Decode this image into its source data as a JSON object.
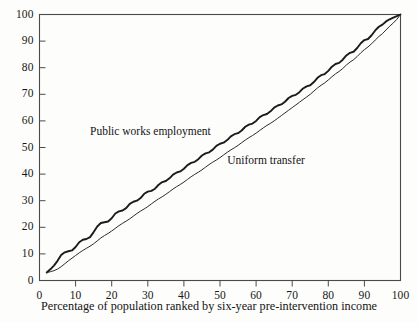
{
  "chart_data": {
    "type": "line",
    "title": "",
    "subtitle": "",
    "xlabel": "Percentage of population ranked by six-year pre-intervention income",
    "ylabel": "",
    "xlim": [
      0,
      100
    ],
    "ylim": [
      0,
      100
    ],
    "grid": false,
    "legend_position": "inline-annotations",
    "xticks": [
      "0",
      "10",
      "20",
      "30",
      "40",
      "50",
      "60",
      "70",
      "80",
      "90",
      "100"
    ],
    "yticks": [
      "0",
      "10",
      "20",
      "30",
      "40",
      "50",
      "60",
      "70",
      "80",
      "90",
      "100"
    ],
    "xtick_values": [
      0,
      10,
      20,
      30,
      40,
      50,
      60,
      70,
      80,
      90,
      100
    ],
    "ytick_values": [
      0,
      10,
      20,
      30,
      40,
      50,
      60,
      70,
      80,
      90,
      100
    ],
    "annotations": [
      {
        "text": "Public works employment",
        "x": 14,
        "y": 56
      },
      {
        "text": "Uniform transfer",
        "x": 52,
        "y": 45
      }
    ],
    "series": [
      {
        "name": "Public works employment",
        "style": "solid",
        "width": 1.9,
        "color": "#1b1b1b",
        "x": [
          2.0,
          3.0,
          4.0,
          5.0,
          6.0,
          7.0,
          8.0,
          9.0,
          10.0,
          11.0,
          12.0,
          13.0,
          14.0,
          15.0,
          16.0,
          17.0,
          18.0,
          19.0,
          20.0,
          21.0,
          22.0,
          23.0,
          24.0,
          25.0,
          26.0,
          27.0,
          28.0,
          29.0,
          30.0,
          31.0,
          32.0,
          33.0,
          34.0,
          35.0,
          36.0,
          37.0,
          38.0,
          39.0,
          40.0,
          41.0,
          42.0,
          43.0,
          44.0,
          45.0,
          46.0,
          47.0,
          48.0,
          49.0,
          50.0,
          51.0,
          52.0,
          53.0,
          54.0,
          55.0,
          56.0,
          57.0,
          58.0,
          59.0,
          60.0,
          61.0,
          62.0,
          63.0,
          64.0,
          65.0,
          66.0,
          67.0,
          68.0,
          69.0,
          70.0,
          71.0,
          72.0,
          73.0,
          74.0,
          75.0,
          76.0,
          77.0,
          78.0,
          79.0,
          80.0,
          81.0,
          82.0,
          83.0,
          84.0,
          85.0,
          86.0,
          87.0,
          88.0,
          89.0,
          90.0,
          91.0,
          92.0,
          93.0,
          94.0,
          95.0,
          96.0,
          97.0,
          98.0,
          99.0,
          100.0
        ],
        "y": [
          3.0,
          4.2,
          5.6,
          7.4,
          9.6,
          10.6,
          11.0,
          11.3,
          12.6,
          14.4,
          15.3,
          15.6,
          16.3,
          18.2,
          20.3,
          21.6,
          21.9,
          22.2,
          23.4,
          25.2,
          26.0,
          26.3,
          27.2,
          28.8,
          29.6,
          30.0,
          31.0,
          32.6,
          33.4,
          33.7,
          34.5,
          36.0,
          37.0,
          37.4,
          38.4,
          39.8,
          40.6,
          41.0,
          42.0,
          43.4,
          44.2,
          44.6,
          45.6,
          47.0,
          47.8,
          48.2,
          49.2,
          50.6,
          51.4,
          51.8,
          52.8,
          54.2,
          55.0,
          55.4,
          56.4,
          57.8,
          58.6,
          59.0,
          60.0,
          61.4,
          62.2,
          62.6,
          63.6,
          65.0,
          65.8,
          66.2,
          67.2,
          68.6,
          69.4,
          69.8,
          70.8,
          72.2,
          73.0,
          73.4,
          74.6,
          76.2,
          77.2,
          77.6,
          78.8,
          80.4,
          81.4,
          81.8,
          83.0,
          84.6,
          85.6,
          86.0,
          87.4,
          89.2,
          90.4,
          90.8,
          92.2,
          94.0,
          95.4,
          96.2,
          97.4,
          98.2,
          98.8,
          99.4,
          100.0
        ]
      },
      {
        "name": "Uniform transfer",
        "style": "solid",
        "width": 1.0,
        "color": "#2a2a2a",
        "x": [
          2.0,
          3.0,
          4.0,
          5.0,
          6.0,
          7.0,
          8.0,
          9.0,
          10.0,
          11.0,
          12.0,
          13.0,
          14.0,
          15.0,
          16.0,
          17.0,
          18.0,
          19.0,
          20.0,
          21.0,
          22.0,
          23.0,
          24.0,
          25.0,
          26.0,
          27.0,
          28.0,
          29.0,
          30.0,
          31.0,
          32.0,
          33.0,
          34.0,
          35.0,
          36.0,
          37.0,
          38.0,
          39.0,
          40.0,
          41.0,
          42.0,
          43.0,
          44.0,
          45.0,
          46.0,
          47.0,
          48.0,
          49.0,
          50.0,
          51.0,
          52.0,
          53.0,
          54.0,
          55.0,
          56.0,
          57.0,
          58.0,
          59.0,
          60.0,
          61.0,
          62.0,
          63.0,
          64.0,
          65.0,
          66.0,
          67.0,
          68.0,
          69.0,
          70.0,
          71.0,
          72.0,
          73.0,
          74.0,
          75.0,
          76.0,
          77.0,
          78.0,
          79.0,
          80.0,
          81.0,
          82.0,
          83.0,
          84.0,
          85.0,
          86.0,
          87.0,
          88.0,
          89.0,
          90.0,
          91.0,
          92.0,
          93.0,
          94.0,
          95.0,
          96.0,
          97.0,
          98.0,
          99.0,
          100.0
        ],
        "y": [
          3.0,
          3.3,
          3.7,
          4.3,
          5.2,
          6.3,
          7.4,
          8.4,
          9.4,
          10.4,
          11.3,
          12.1,
          12.9,
          13.8,
          14.9,
          16.0,
          16.9,
          17.7,
          18.6,
          19.6,
          20.6,
          21.5,
          22.3,
          23.2,
          24.2,
          25.2,
          26.1,
          26.9,
          27.8,
          28.8,
          29.8,
          30.7,
          31.5,
          32.4,
          33.4,
          34.4,
          35.3,
          36.1,
          37.0,
          38.0,
          39.0,
          39.9,
          40.7,
          41.6,
          42.6,
          43.6,
          44.5,
          45.3,
          46.2,
          47.2,
          48.2,
          49.1,
          49.9,
          50.8,
          51.8,
          52.8,
          53.7,
          54.5,
          55.4,
          56.4,
          57.4,
          58.3,
          59.1,
          60.0,
          61.0,
          62.0,
          63.0,
          64.0,
          65.0,
          66.0,
          67.0,
          68.0,
          69.0,
          70.0,
          71.2,
          72.4,
          73.4,
          74.3,
          75.4,
          76.6,
          77.7,
          78.6,
          79.7,
          81.0,
          82.1,
          83.0,
          84.2,
          85.6,
          86.8,
          87.8,
          89.0,
          90.4,
          91.7,
          92.8,
          94.2,
          95.6,
          96.8,
          98.2,
          100.0
        ]
      }
    ]
  },
  "axes": {
    "frame_color": "#4a4a4a",
    "text_color": "#171717"
  }
}
